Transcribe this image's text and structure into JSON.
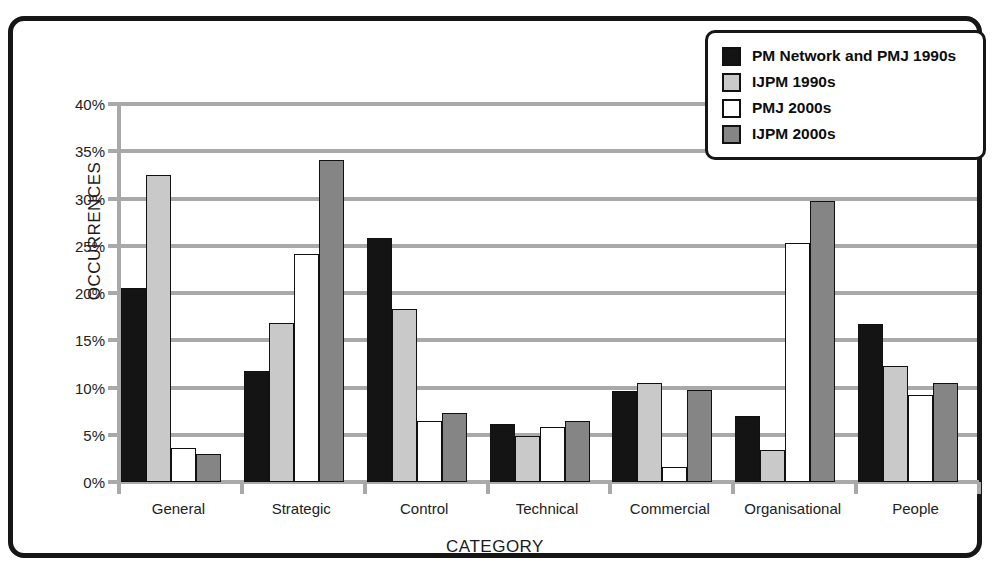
{
  "chart_data": {
    "type": "bar",
    "title": "",
    "xlabel": "CATEGORY",
    "ylabel": "OCCURRENCES",
    "categories": [
      "General",
      "Strategic",
      "Control",
      "Technical",
      "Commercial",
      "Organisational",
      "People"
    ],
    "series": [
      {
        "name": "PM Network and PMJ 1990s",
        "color": "#141414",
        "values": [
          20.5,
          11.7,
          25.8,
          6.1,
          9.6,
          7.0,
          16.7
        ]
      },
      {
        "name": "IJPM 1990s",
        "color": "#c9c9c9",
        "values": [
          32.5,
          16.8,
          18.3,
          4.9,
          10.5,
          3.4,
          12.3
        ]
      },
      {
        "name": "PMJ 2000s",
        "color": "#ffffff",
        "values": [
          3.6,
          24.1,
          6.5,
          5.8,
          1.6,
          25.3,
          9.2
        ]
      },
      {
        "name": "IJPM 2000s",
        "color": "#858585",
        "values": [
          3.0,
          34.1,
          7.3,
          6.5,
          9.7,
          29.7,
          10.5
        ]
      }
    ],
    "ylim": [
      0,
      40
    ],
    "ytick_step": 5,
    "ytick_labels": [
      "0%",
      "5%",
      "10%",
      "15%",
      "20%",
      "25%",
      "30%",
      "35%",
      "40%"
    ],
    "grid": true,
    "legend_position": "top-right",
    "value_suffix": "%"
  }
}
